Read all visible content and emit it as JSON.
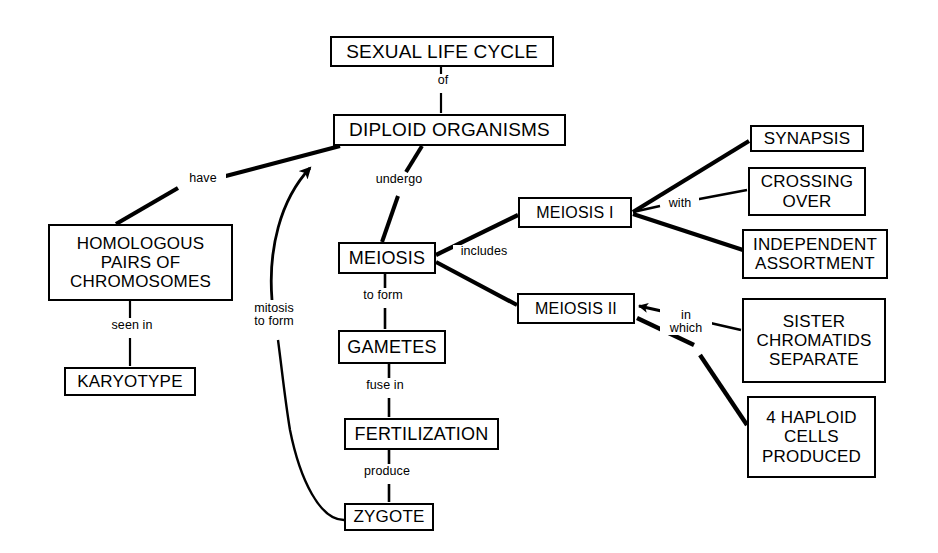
{
  "diagram": {
    "line_color": "#000000",
    "background_color": "#ffffff",
    "text_color": "#000000"
  },
  "nodes": [
    {
      "id": "sexual_life_cycle",
      "label": "SEXUAL LIFE CYCLE",
      "x": 330,
      "y": 36,
      "w": 224,
      "h": 31,
      "font": 19
    },
    {
      "id": "diploid_organisms",
      "label": "DIPLOID ORGANISMS",
      "x": 333,
      "y": 114,
      "w": 233,
      "h": 32,
      "font": 19
    },
    {
      "id": "homologous_pairs",
      "label": "HOMOLOGOUS\nPAIRS OF\nCHROMOSOMES",
      "x": 48,
      "y": 224,
      "w": 185,
      "h": 77,
      "font": 17
    },
    {
      "id": "karyotype",
      "label": "KARYOTYPE",
      "x": 64,
      "y": 367,
      "w": 132,
      "h": 29,
      "font": 17
    },
    {
      "id": "meiosis",
      "label": "MEIOSIS",
      "x": 338,
      "y": 242,
      "w": 98,
      "h": 32,
      "font": 18
    },
    {
      "id": "gametes",
      "label": "GAMETES",
      "x": 338,
      "y": 330,
      "w": 108,
      "h": 34,
      "font": 18
    },
    {
      "id": "fertilization",
      "label": "FERTILIZATION",
      "x": 344,
      "y": 418,
      "w": 155,
      "h": 32,
      "font": 18
    },
    {
      "id": "zygote",
      "label": "ZYGOTE",
      "x": 344,
      "y": 503,
      "w": 90,
      "h": 28,
      "font": 17
    },
    {
      "id": "meiosis_i",
      "label": "MEIOSIS I",
      "x": 518,
      "y": 197,
      "w": 114,
      "h": 31,
      "font": 16
    },
    {
      "id": "meiosis_ii",
      "label": "MEIOSIS II",
      "x": 517,
      "y": 293,
      "w": 118,
      "h": 31,
      "font": 16
    },
    {
      "id": "synapsis",
      "label": "SYNAPSIS",
      "x": 750,
      "y": 125,
      "w": 114,
      "h": 27,
      "font": 17
    },
    {
      "id": "crossing_over",
      "label": "CROSSING\nOVER",
      "x": 748,
      "y": 167,
      "w": 118,
      "h": 49,
      "font": 17
    },
    {
      "id": "independent_assortment",
      "label": "INDEPENDENT\nASSORTMENT",
      "x": 742,
      "y": 229,
      "w": 146,
      "h": 50,
      "font": 17
    },
    {
      "id": "sister_chromatids",
      "label": "SISTER\nCHROMATIDS\nSEPARATE",
      "x": 742,
      "y": 298,
      "w": 144,
      "h": 85,
      "font": 17
    },
    {
      "id": "haploid_cells",
      "label": "4 HAPLOID\nCELLS\nPRODUCED",
      "x": 747,
      "y": 396,
      "w": 129,
      "h": 82,
      "font": 17
    }
  ],
  "edge_labels": [
    {
      "id": "of",
      "text": "of",
      "x": 435,
      "y": 80,
      "from": "sexual_life_cycle",
      "to": "diploid_organisms"
    },
    {
      "id": "have",
      "text": "have",
      "x": 188,
      "y": 180,
      "from": "homologous_pairs",
      "to": "diploid_organisms"
    },
    {
      "id": "seen_in",
      "text": "seen in",
      "x": 112,
      "y": 325,
      "from": "homologous_pairs",
      "to": "karyotype"
    },
    {
      "id": "undergo",
      "text": "undergo",
      "x": 371,
      "y": 179,
      "from": "diploid_organisms",
      "to": "meiosis"
    },
    {
      "id": "includes",
      "text": "includes",
      "x": 457,
      "y": 251,
      "from": "meiosis",
      "to": "meiosis_i"
    },
    {
      "id": "to_form",
      "text": "to form",
      "x": 359,
      "y": 296,
      "from": "meiosis",
      "to": "gametes"
    },
    {
      "id": "fuse_in",
      "text": "fuse in",
      "x": 362,
      "y": 386,
      "from": "gametes",
      "to": "fertilization"
    },
    {
      "id": "produce",
      "text": "produce",
      "x": 362,
      "y": 472,
      "from": "fertilization",
      "to": "zygote"
    },
    {
      "id": "mitosis_to_form",
      "text": "mitosis\nto form",
      "x": 269,
      "y": 274,
      "from": "zygote",
      "to": "diploid_organisms"
    },
    {
      "id": "with",
      "text": "with",
      "x": 669,
      "y": 204,
      "from": "meiosis_i",
      "to": "crossing_over"
    },
    {
      "id": "in_which",
      "text": "in\nwhich",
      "x": 681,
      "y": 318,
      "from": "sister_chromatids",
      "to": "meiosis_ii"
    }
  ],
  "edges": [
    {
      "id": "slc-to-do",
      "from": "sexual_life_cycle",
      "to": "diploid_organisms",
      "style": "thin"
    },
    {
      "id": "hp-to-do",
      "from": "homologous_pairs",
      "to": "diploid_organisms",
      "style": "thick"
    },
    {
      "id": "hp-to-kt",
      "from": "homologous_pairs",
      "to": "karyotype",
      "style": "thin"
    },
    {
      "id": "do-to-meiosis",
      "from": "diploid_organisms",
      "to": "meiosis",
      "style": "thick"
    },
    {
      "id": "meiosis-to-gametes",
      "from": "meiosis",
      "to": "gametes",
      "style": "thin"
    },
    {
      "id": "gametes-to-fert",
      "from": "gametes",
      "to": "fertilization",
      "style": "thin"
    },
    {
      "id": "fert-to-zygote",
      "from": "fertilization",
      "to": "zygote",
      "style": "thin"
    },
    {
      "id": "zygote-to-do",
      "from": "zygote",
      "to": "diploid_organisms",
      "style": "curve-arrow"
    },
    {
      "id": "meiosis-to-mi",
      "from": "meiosis",
      "to": "meiosis_i",
      "style": "thick"
    },
    {
      "id": "meiosis-to-mii",
      "from": "meiosis",
      "to": "meiosis_ii",
      "style": "thick"
    },
    {
      "id": "mi-to-synapsis",
      "from": "meiosis_i",
      "to": "synapsis",
      "style": "thick"
    },
    {
      "id": "mi-to-crossing",
      "from": "meiosis_i",
      "to": "crossing_over",
      "style": "thin"
    },
    {
      "id": "mi-to-independent",
      "from": "meiosis_i",
      "to": "independent_assortment",
      "style": "thick"
    },
    {
      "id": "sister-to-mii",
      "from": "sister_chromatids",
      "to": "meiosis_ii",
      "style": "thin-arrow"
    },
    {
      "id": "haploid-to-mii",
      "from": "haploid_cells",
      "to": "meiosis_ii",
      "style": "thick"
    }
  ]
}
